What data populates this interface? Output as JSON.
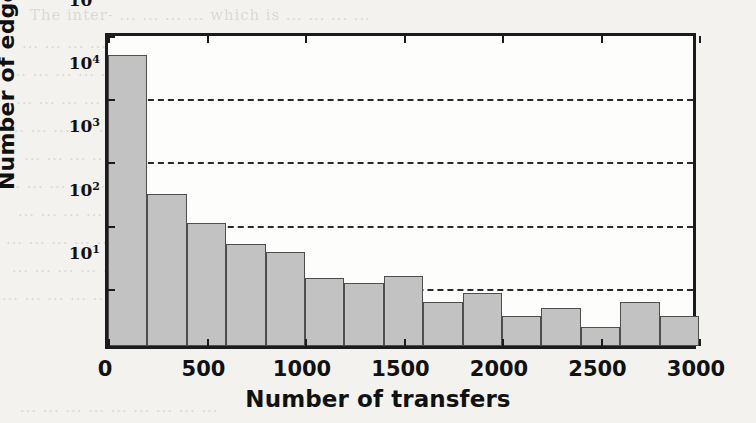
{
  "figure": {
    "background_color": "#f4f2ee",
    "axes_color": "#1b1b1b",
    "bar_fill_color": "#c2c2c2",
    "bar_edge_color": "#4e4e4e",
    "gridline_color": "#2a2a2a"
  },
  "axis_labels": {
    "x": "Number of transfers",
    "y_prefix": "Number of edges (log",
    "y_sub": "10",
    "y_suffix": ")"
  },
  "ticks": {
    "x": [
      "0",
      "500",
      "1000",
      "1500",
      "2000",
      "2500",
      "3000"
    ],
    "y": [
      {
        "mantissa": "10",
        "exponent": "1"
      },
      {
        "mantissa": "10",
        "exponent": "2"
      },
      {
        "mantissa": "10",
        "exponent": "3"
      },
      {
        "mantissa": "10",
        "exponent": "4"
      },
      {
        "mantissa": "10",
        "exponent": "5"
      }
    ]
  },
  "chart_data": {
    "type": "bar",
    "title": "",
    "xlabel": "Number of transfers",
    "ylabel": "Number of edges (log10)",
    "yscale": "log",
    "ylim": [
      1,
      100000
    ],
    "xlim": [
      0,
      3000
    ],
    "grid": true,
    "grid_axis": "y",
    "grid_style": "dashed",
    "legend": null,
    "bin_width": 200,
    "bin_edges": [
      0,
      200,
      400,
      600,
      800,
      1000,
      1200,
      1400,
      1600,
      1800,
      2000,
      2200,
      2400,
      2600,
      2800,
      3000
    ],
    "bin_centers": [
      100,
      300,
      500,
      700,
      900,
      1100,
      1300,
      1500,
      1700,
      1900,
      2100,
      2300,
      2500,
      2700,
      2900
    ],
    "categories": [
      "0-200",
      "200-400",
      "400-600",
      "600-800",
      "800-1000",
      "1000-1200",
      "1200-1400",
      "1400-1600",
      "1600-1800",
      "1800-2000",
      "2000-2200",
      "2200-2400",
      "2400-2600",
      "2600-2800",
      "2800-3000"
    ],
    "values": [
      40000,
      250,
      88,
      41,
      31,
      12,
      10,
      13,
      5,
      7,
      3,
      4,
      2,
      5,
      3
    ],
    "ytick_values": [
      10,
      100,
      1000,
      10000,
      100000
    ],
    "xtick_values": [
      0,
      500,
      1000,
      1500,
      2000,
      2500,
      3000
    ]
  },
  "bleed_through_lines": [
    {
      "x": 30,
      "y": 6,
      "text": "The  inter- ... ... ... ... which  is  ...  ... ... ..."
    },
    {
      "x": 22,
      "y": 34,
      "text": "... ...   ...  ...   ...  ...   ...   ...  ...  ..."
    },
    {
      "x": 10,
      "y": 62,
      "text": "...  ...  ...  ...  ...   ...  ...  ...  ...  ..."
    },
    {
      "x": 16,
      "y": 90,
      "text": "...  ...  ...  ...   ...  ...  ...   ...   ..."
    },
    {
      "x": 8,
      "y": 118,
      "text": "...   ...  ...   ...   ...  ...   ...  ...  ..."
    },
    {
      "x": 24,
      "y": 146,
      "text": "...   ...  ...   ...   ...   ...   ...   ..."
    },
    {
      "x": 4,
      "y": 174,
      "text": "...  ...   ...   ...  ...  ...   ...   ...  ..."
    },
    {
      "x": 18,
      "y": 202,
      "text": "...   ...   ...  ...   ...   ...  ...   ..."
    },
    {
      "x": 6,
      "y": 230,
      "text": "...  ...   ...   ...  ...   ...   ...  ...  ..."
    },
    {
      "x": 12,
      "y": 258,
      "text": "...   ...  ...   ...   ...  ...   ...   ..."
    },
    {
      "x": 2,
      "y": 286,
      "text": "...  ...   ...   ...   ...  ...   ...  ...   ..."
    },
    {
      "x": 20,
      "y": 398,
      "text": "...   ...  ...   ...   ...  ...   ...   ...  ..."
    }
  ]
}
